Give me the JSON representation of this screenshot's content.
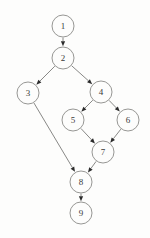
{
  "figure": {
    "width": 150,
    "height": 238,
    "background_color": "#fdfdfc",
    "node_fill_color": "#fdfdfc",
    "node_stroke_color": "#8b8b88",
    "edge_color": "#7a7a78",
    "arrowhead_color": "#2b2b2b",
    "label_color": "#3a3a38",
    "node_radius": 11
  },
  "chart_data": {
    "type": "diagram",
    "diagram_type": "directed-graph",
    "directed": true,
    "node_count": 9,
    "edge_count": 10,
    "nodes": [
      {
        "id": "1",
        "label": "1",
        "x": 63,
        "y": 26
      },
      {
        "id": "2",
        "label": "2",
        "x": 63,
        "y": 58
      },
      {
        "id": "3",
        "label": "3",
        "x": 28,
        "y": 93
      },
      {
        "id": "4",
        "label": "4",
        "x": 101,
        "y": 92
      },
      {
        "id": "5",
        "label": "5",
        "x": 73,
        "y": 120
      },
      {
        "id": "6",
        "label": "6",
        "x": 128,
        "y": 120
      },
      {
        "id": "7",
        "label": "7",
        "x": 103,
        "y": 152
      },
      {
        "id": "8",
        "label": "8",
        "x": 81,
        "y": 182
      },
      {
        "id": "9",
        "label": "9",
        "x": 81,
        "y": 213
      }
    ],
    "edges": [
      {
        "from": "1",
        "to": "2"
      },
      {
        "from": "2",
        "to": "3"
      },
      {
        "from": "2",
        "to": "4"
      },
      {
        "from": "3",
        "to": "8"
      },
      {
        "from": "4",
        "to": "5"
      },
      {
        "from": "4",
        "to": "6"
      },
      {
        "from": "5",
        "to": "7"
      },
      {
        "from": "6",
        "to": "7"
      },
      {
        "from": "7",
        "to": "8"
      },
      {
        "from": "8",
        "to": "9"
      }
    ]
  }
}
